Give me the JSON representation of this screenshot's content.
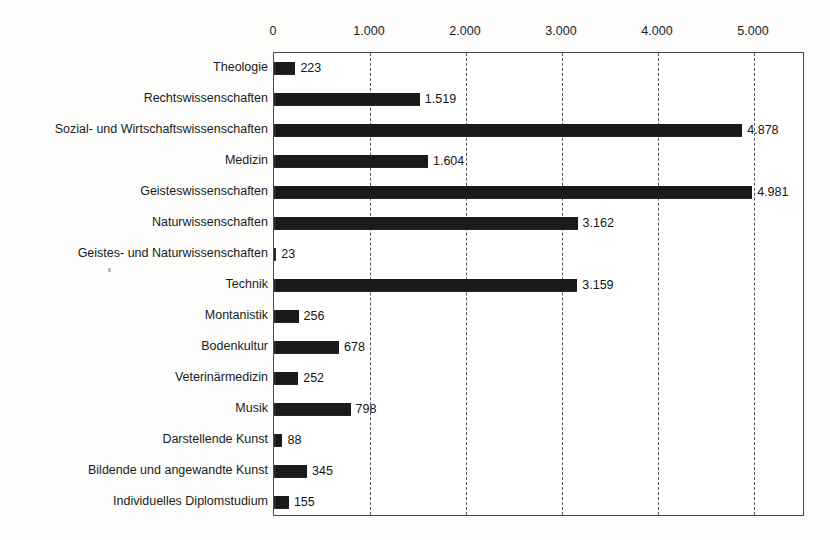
{
  "title_remnant": "",
  "axis": {
    "tick_labels": [
      "0",
      "1.000",
      "2.000",
      "3.000",
      "4.000",
      "5.000"
    ],
    "tick_values": [
      0,
      1000,
      2000,
      3000,
      4000,
      5000
    ],
    "position": "top"
  },
  "colors": {
    "bar": "#1a1a1a",
    "plot_border": "#4a4a4a",
    "gridline": "#555555",
    "background": "#fdfdfc",
    "plot_background": "#ffffff",
    "text": "#1b1b1b"
  },
  "chart_data": {
    "type": "bar",
    "orientation": "horizontal",
    "title": "",
    "subtitle": "",
    "xlabel": "",
    "ylabel": "",
    "xlim": [
      0,
      5540
    ],
    "grid": true,
    "grid_axis": "x",
    "grid_style": "dashed",
    "legend": false,
    "axis_position": "top",
    "thousands_separator": ".",
    "categories": [
      "Theologie",
      "Rechtswissenschaften",
      "Sozial- und Wirtschaftswissenschaften",
      "Medizin",
      "Geisteswissenschaften",
      "Naturwissenschaften",
      "Geistes- und Naturwissenschaften",
      "Technik",
      "Montanistik",
      "Bodenkultur",
      "Veterinärmedizin",
      "Musik",
      "Darstellende Kunst",
      "Bildende und angewandte Kunst",
      "Individuelles Diplomstudium"
    ],
    "values": [
      223,
      1519,
      4878,
      1604,
      4981,
      3162,
      23,
      3159,
      256,
      678,
      252,
      798,
      88,
      345,
      155
    ],
    "value_labels": [
      "223",
      "1.519",
      "4.878",
      "1.604",
      "4.981",
      "3.162",
      "23",
      "3.159",
      "256",
      "678",
      "252",
      "798",
      "88",
      "345",
      "155"
    ]
  }
}
